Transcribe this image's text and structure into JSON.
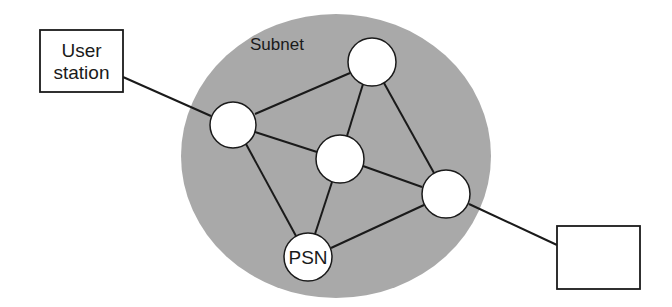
{
  "diagram": {
    "title": "",
    "colors": {
      "background": "#ffffff",
      "subnet_fill": "#a9a9a9",
      "node_fill": "#ffffff",
      "stroke": "#1a1a1a"
    },
    "subnet": {
      "label": "Subnet",
      "cx": 336,
      "cy": 156,
      "rx": 155,
      "ry": 142
    },
    "nodes": [
      {
        "id": "top",
        "label": "",
        "cx": 372,
        "cy": 62,
        "r": 24
      },
      {
        "id": "left",
        "label": "",
        "cx": 233,
        "cy": 125,
        "r": 23
      },
      {
        "id": "center",
        "label": "",
        "cx": 340,
        "cy": 159,
        "r": 24
      },
      {
        "id": "right",
        "label": "",
        "cx": 446,
        "cy": 194,
        "r": 24
      },
      {
        "id": "psn",
        "label": "PSN",
        "cx": 308,
        "cy": 257,
        "r": 24
      }
    ],
    "boxes": [
      {
        "id": "user-station",
        "lines": [
          "User",
          "station"
        ],
        "x": 40,
        "y": 30,
        "w": 83,
        "h": 62
      },
      {
        "id": "remote-station",
        "lines": [],
        "x": 557,
        "y": 226,
        "w": 83,
        "h": 63
      }
    ],
    "edges": [
      {
        "from": "user-station",
        "to": "left",
        "x1": 123,
        "y1": 77,
        "x2": 211,
        "y2": 116
      },
      {
        "from": "left",
        "to": "top",
        "x1": 255,
        "y1": 114,
        "x2": 350,
        "y2": 73
      },
      {
        "from": "left",
        "to": "center",
        "x1": 255,
        "y1": 132,
        "x2": 317,
        "y2": 152
      },
      {
        "from": "left",
        "to": "psn",
        "x1": 246,
        "y1": 144,
        "x2": 296,
        "y2": 236
      },
      {
        "from": "top",
        "to": "center",
        "x1": 363,
        "y1": 84,
        "x2": 347,
        "y2": 136
      },
      {
        "from": "top",
        "to": "right",
        "x1": 384,
        "y1": 83,
        "x2": 434,
        "y2": 173
      },
      {
        "from": "center",
        "to": "right",
        "x1": 363,
        "y1": 166,
        "x2": 422,
        "y2": 187
      },
      {
        "from": "center",
        "to": "psn",
        "x1": 332,
        "y1": 182,
        "x2": 315,
        "y2": 234
      },
      {
        "from": "psn",
        "to": "right",
        "x1": 331,
        "y1": 248,
        "x2": 424,
        "y2": 205
      },
      {
        "from": "right",
        "to": "remote-station",
        "x1": 469,
        "y1": 204,
        "x2": 557,
        "y2": 245
      }
    ]
  }
}
